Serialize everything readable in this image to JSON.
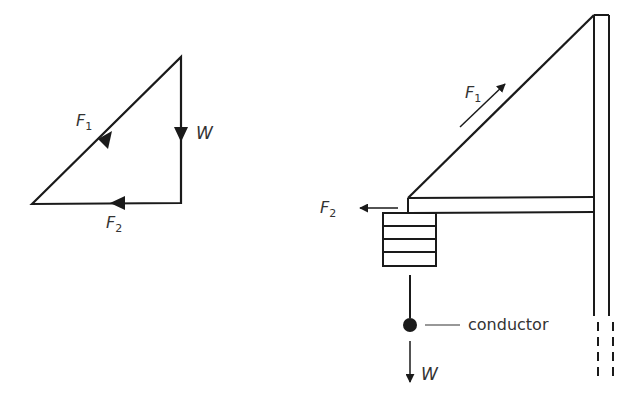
{
  "triangle_of_forces": {
    "f1_label": "F",
    "f1_sub": "1",
    "f2_label": "F",
    "f2_sub": "2",
    "w_label": "W"
  },
  "pole_diagram": {
    "f1_label": "F",
    "f1_sub": "1",
    "f2_label": "F",
    "f2_sub": "2",
    "w_label": "W",
    "conductor_label": "conductor"
  },
  "colors": {
    "stroke": "#1a1a1a",
    "text": "#333333",
    "background": "#ffffff"
  }
}
